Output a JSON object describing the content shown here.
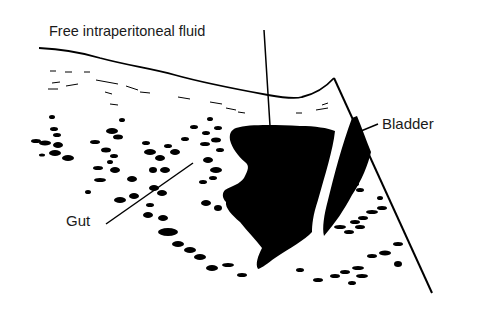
{
  "figure": {
    "type": "ultrasound-schematic",
    "labels": {
      "fluid": "Free intraperitoneal fluid",
      "bladder": "Bladder",
      "gut": "Gut"
    },
    "colors": {
      "ink": "#000000",
      "background": "#ffffff",
      "text": "#1a1a1a"
    }
  }
}
